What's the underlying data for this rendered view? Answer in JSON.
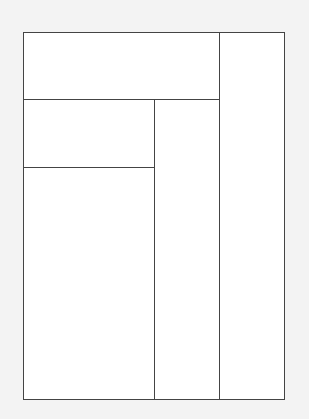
{
  "diagram": {
    "type": "rectangle-partition",
    "background_color": "#f3f3f3",
    "fill_color": "#ffffff",
    "stroke_color": "#444444",
    "outer": {
      "x": 23,
      "y": 32,
      "w": 262,
      "h": 368
    },
    "regions": [
      {
        "id": "top-left",
        "x": 23,
        "y": 32,
        "w": 196,
        "h": 67
      },
      {
        "id": "right-column",
        "x": 219,
        "y": 32,
        "w": 66,
        "h": 368
      },
      {
        "id": "middle-left",
        "x": 23,
        "y": 99,
        "w": 131,
        "h": 68
      },
      {
        "id": "middle-column",
        "x": 154,
        "y": 99,
        "w": 65,
        "h": 301
      },
      {
        "id": "bottom-left",
        "x": 23,
        "y": 167,
        "w": 131,
        "h": 233
      }
    ]
  }
}
